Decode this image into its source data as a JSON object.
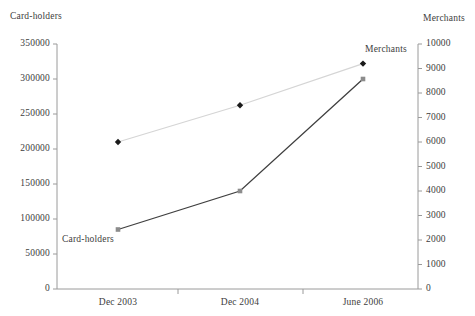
{
  "chart_data": {
    "type": "line",
    "title": "",
    "xlabel": "",
    "categories": [
      "Dec 2003",
      "Dec 2004",
      "June 2006"
    ],
    "grid": false,
    "legend_position": "inline-annotations",
    "series": [
      {
        "name": "Card-holders",
        "axis": "left",
        "values": [
          85000,
          140000,
          300000
        ],
        "color": "#3f3f3f",
        "marker": "square",
        "marker_color": "#8c8c8c"
      },
      {
        "name": "Merchants",
        "axis": "right",
        "values": [
          6000,
          7500,
          9200
        ],
        "color": "#d5d5d5",
        "marker": "diamond",
        "marker_color": "#1a1a1a"
      }
    ],
    "left_axis": {
      "label": "Card-holders",
      "ylim": [
        0,
        350000
      ],
      "ticks": [
        "0",
        "50000",
        "100000",
        "150000",
        "200000",
        "250000",
        "300000",
        "350000"
      ],
      "tick_values": [
        0,
        50000,
        100000,
        150000,
        200000,
        250000,
        300000,
        350000
      ]
    },
    "right_axis": {
      "label": "Merchants",
      "ylim": [
        0,
        10000
      ],
      "ticks": [
        "0",
        "1000",
        "2000",
        "3000",
        "4000",
        "5000",
        "6000",
        "7000",
        "8000",
        "9000",
        "10000"
      ],
      "tick_values": [
        0,
        1000,
        2000,
        3000,
        4000,
        5000,
        6000,
        7000,
        8000,
        9000,
        10000
      ]
    },
    "annotations": [
      {
        "text": "Merchants",
        "x": 365,
        "y": 44
      },
      {
        "text": "Card-holders",
        "x": 62,
        "y": 234
      }
    ]
  },
  "colors": {
    "axis": "#9a9a9a",
    "text": "#3d3d3d",
    "card_holders_line": "#3f3f3f",
    "merchants_line": "#d5d5d5",
    "background": "#ffffff"
  }
}
